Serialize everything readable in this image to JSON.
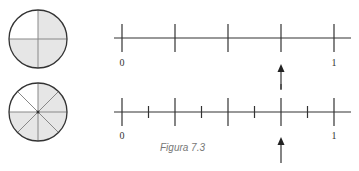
{
  "figure": {
    "caption": "Figura 7.3",
    "colors": {
      "stroke": "#333333",
      "shade": "#e6e6e6",
      "divider": "#888888"
    },
    "circles": [
      {
        "parts": 4,
        "shaded": 3,
        "fraction": "3/4"
      },
      {
        "parts": 8,
        "shaded": 6,
        "fraction": "6/8"
      }
    ],
    "number_lines": [
      {
        "start_label": "0",
        "end_label": "1",
        "major_divisions": 4,
        "minor_divisions": 0,
        "arrow_at": "3/4"
      },
      {
        "start_label": "0",
        "end_label": "1",
        "major_divisions": 4,
        "minor_divisions": 8,
        "arrow_at": "6/8"
      }
    ]
  }
}
